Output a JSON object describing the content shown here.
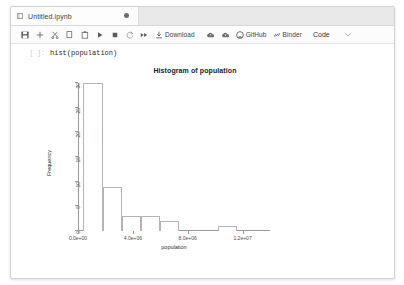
{
  "window": {
    "tab": {
      "title": "Untitled.ipynb",
      "icon": "notebook-icon",
      "modified_dot": "●"
    }
  },
  "toolbar": {
    "items": [
      {
        "name": "save-button",
        "icon": "save-icon",
        "label": ""
      },
      {
        "name": "insert-cell-button",
        "icon": "plus-icon",
        "label": ""
      },
      {
        "name": "cut-cell-button",
        "icon": "scissors-icon",
        "label": ""
      },
      {
        "name": "copy-cell-button",
        "icon": "copy-icon",
        "label": ""
      },
      {
        "name": "paste-cell-button",
        "icon": "paste-icon",
        "label": ""
      },
      {
        "name": "run-cell-button",
        "icon": "play-icon",
        "label": ""
      },
      {
        "name": "stop-kernel-button",
        "icon": "stop-square-icon",
        "label": ""
      },
      {
        "name": "restart-kernel-button",
        "icon": "restart-circle-icon",
        "label": ""
      },
      {
        "name": "restart-run-all-button",
        "icon": "fast-forward-icon",
        "label": ""
      },
      {
        "name": "download-button",
        "icon": "download-icon",
        "label": "Download"
      },
      {
        "name": "upload-cloud-button",
        "icon": "cloud-up-icon",
        "label": ""
      },
      {
        "name": "save-cloud-button",
        "icon": "cloud-down-icon",
        "label": ""
      },
      {
        "name": "github-button",
        "icon": "github-icon",
        "label": "GitHub"
      },
      {
        "name": "binder-button",
        "icon": "link-icon",
        "label": "Binder"
      }
    ],
    "download_label": "Download",
    "github_label": "GitHub",
    "binder_label": "Binder",
    "celltype_label": "Code",
    "celltype_chevron": "⌄"
  },
  "notebook": {
    "cell": {
      "prompt": "[ ]:",
      "source": "hist(population)"
    }
  },
  "chart_data": {
    "type": "bar",
    "title": "Histogram of population",
    "xlabel": "population",
    "ylabel": "Frequency",
    "grid": false,
    "legend": null,
    "xlim": [
      0,
      14000000
    ],
    "ylim": [
      0,
      30
    ],
    "xticks": [
      0,
      4000000,
      8000000,
      12000000
    ],
    "xticklabels": [
      "0.0e+00",
      "4.0e+06",
      "8.0e+06",
      "1.2e+07"
    ],
    "yticks": [
      0,
      5,
      10,
      15,
      20,
      25,
      30
    ],
    "yticklabels": [
      "0",
      "5",
      "10",
      "15",
      "20",
      "25",
      "30"
    ],
    "bin_edges": [
      0,
      1000000,
      2000000,
      3000000,
      4000000,
      5000000,
      6000000,
      7000000,
      8000000
    ],
    "bins": [
      {
        "left": 400000,
        "right": 1800000,
        "count": 30
      },
      {
        "left": 1800000,
        "right": 3200000,
        "count": 9
      },
      {
        "left": 3200000,
        "right": 4600000,
        "count": 3
      },
      {
        "left": 4600000,
        "right": 6000000,
        "count": 3
      },
      {
        "left": 6000000,
        "right": 7400000,
        "count": 2
      },
      {
        "left": 10200000,
        "right": 11600000,
        "count": 1
      }
    ],
    "categories": [
      "0.4-1.8M",
      "1.8-3.2M",
      "3.2-4.6M",
      "4.6-6.0M",
      "6.0-7.4M",
      "10.2-11.6M"
    ],
    "values": [
      30,
      9,
      3,
      3,
      2,
      1
    ]
  }
}
